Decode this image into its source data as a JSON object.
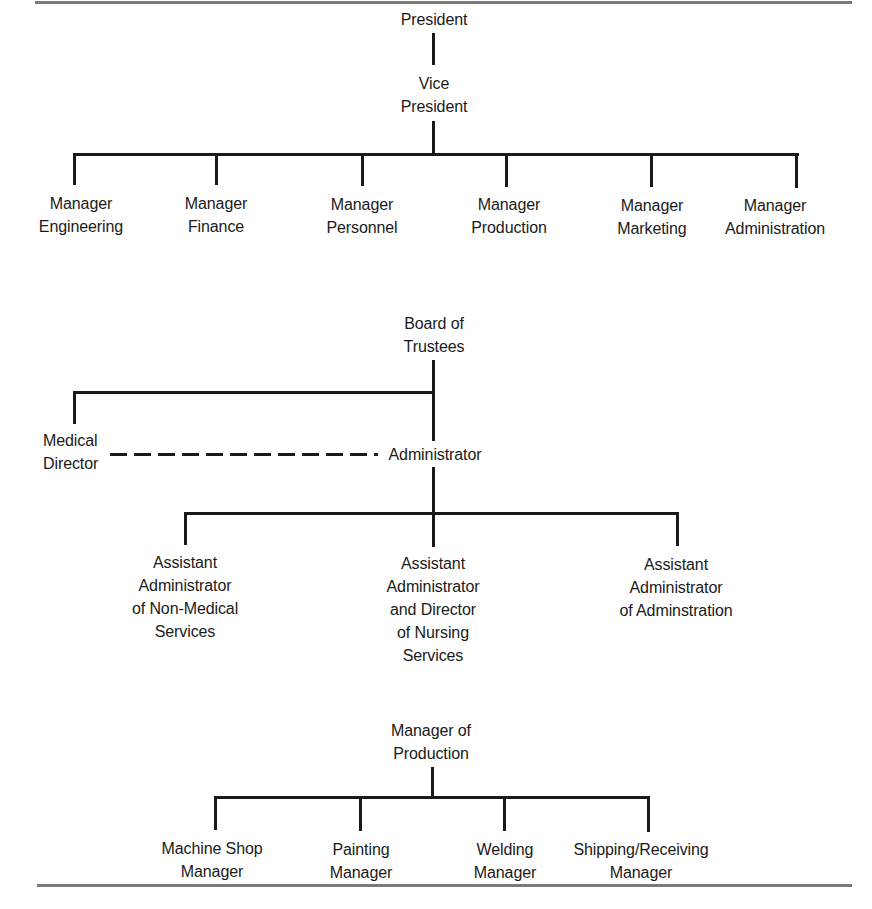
{
  "charts": [
    {
      "id": "functional-org-chart",
      "root": {
        "lines": [
          "President"
        ]
      },
      "second": {
        "lines": [
          "Vice",
          "President"
        ]
      },
      "children": [
        {
          "lines": [
            "Manager",
            "Engineering"
          ]
        },
        {
          "lines": [
            "Manager",
            "Finance"
          ]
        },
        {
          "lines": [
            "Manager",
            "Personnel"
          ]
        },
        {
          "lines": [
            "Manager",
            "Production"
          ]
        },
        {
          "lines": [
            "Manager",
            "Marketing"
          ]
        },
        {
          "lines": [
            "Manager",
            "Administration"
          ]
        }
      ]
    },
    {
      "id": "hospital-org-chart",
      "root": {
        "lines": [
          "Board of",
          "Trustees"
        ]
      },
      "staff": {
        "lines": [
          "Medical",
          "Director"
        ]
      },
      "second": {
        "lines": [
          "Administrator"
        ]
      },
      "staff_relation": "dashed",
      "children": [
        {
          "lines": [
            "Assistant",
            "Administrator",
            "of Non-Medical",
            "Services"
          ]
        },
        {
          "lines": [
            "Assistant",
            "Administrator",
            "and Director",
            "of Nursing",
            "Services"
          ]
        },
        {
          "lines": [
            "Assistant",
            "Administrator",
            "of Adminstration"
          ]
        }
      ]
    },
    {
      "id": "production-org-chart",
      "root": {
        "lines": [
          "Manager of",
          "Production"
        ]
      },
      "children": [
        {
          "lines": [
            "Machine Shop",
            "Manager"
          ]
        },
        {
          "lines": [
            "Painting",
            "Manager"
          ]
        },
        {
          "lines": [
            "Welding",
            "Manager"
          ]
        },
        {
          "lines": [
            "Shipping/Receiving",
            "Manager"
          ]
        }
      ]
    }
  ],
  "colors": {
    "line": "#1a1a1a",
    "rule": "#7a7a7a",
    "text": "#1a1a1a",
    "background": "#ffffff"
  }
}
